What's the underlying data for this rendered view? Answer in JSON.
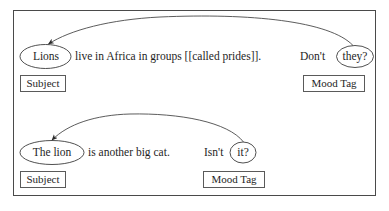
{
  "figure": {
    "type": "linguistic-annotation-diagram",
    "frame": {
      "border_color": "#4a4a4a"
    },
    "background": "#ffffff",
    "ink_color": "#1e1e1e",
    "rows": [
      {
        "id": "row-1",
        "subject_node": "Lions",
        "sentence_middle": "live in Africa in groups [[called prides]].",
        "tag_lead_word": "Don't",
        "mood_node": "they?",
        "subject_tag": "Subject",
        "mood_tag": "Mood Tag",
        "arrow": {
          "from": "they?",
          "to": "Lions",
          "direction": "right-to-left",
          "style": "curved-arc-with-arrowhead"
        }
      },
      {
        "id": "row-2",
        "subject_node": "The lion",
        "sentence_middle": "is another big cat.",
        "tag_lead_word": "Isn't",
        "mood_node": "it?",
        "subject_tag": "Subject",
        "mood_tag": "Mood Tag",
        "arrow": {
          "from": "it?",
          "to": "The lion",
          "direction": "right-to-left",
          "style": "curved-arc-with-arrowhead"
        }
      }
    ]
  }
}
